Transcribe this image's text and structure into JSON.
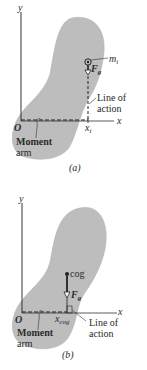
{
  "figure": {
    "panels": [
      {
        "id": "a",
        "caption": "(a)",
        "axis_y": "y",
        "axis_x": "x",
        "origin": "O",
        "particle_label": "m",
        "particle_sub": "i",
        "force_label": "F",
        "force_sub": "g",
        "position_label": "x",
        "position_sub": "i",
        "line_of_action": [
          "Line of",
          "action"
        ],
        "moment_arm": [
          "Moment",
          "arm"
        ]
      },
      {
        "id": "b",
        "caption": "(b)",
        "axis_y": "y",
        "axis_x": "x",
        "origin": "O",
        "point_label": "cog",
        "force_label": "F",
        "force_sub": "g",
        "position_label": "x",
        "position_sub": "cog",
        "line_of_action": [
          "Line of",
          "action"
        ],
        "moment_arm": [
          "Moment",
          "arm"
        ]
      }
    ],
    "colors": {
      "body_fill": "#bdbdbd",
      "ink": "#2a2a2a",
      "background": "#ffffff"
    }
  }
}
